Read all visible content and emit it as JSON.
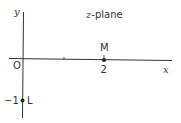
{
  "diagram": {
    "title_var": "z",
    "title_rest": "-plane",
    "axes": {
      "x_label": "x",
      "y_label": "y",
      "origin_label": "O"
    },
    "points": [
      {
        "name": "M",
        "value_label": "2",
        "x": 2,
        "y": 0
      },
      {
        "name": "L",
        "value_label": "−1",
        "x": 0,
        "y": -1
      }
    ],
    "tick_positions": [
      1
    ],
    "colors": {
      "stroke": "#333333",
      "background": "#ffffff"
    }
  }
}
